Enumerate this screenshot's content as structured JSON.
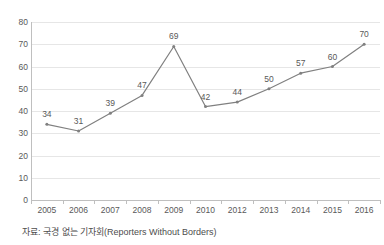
{
  "chart_data": {
    "type": "line",
    "title": "",
    "xlabel": "",
    "ylabel": "",
    "categories": [
      "2005",
      "2006",
      "2007",
      "2008",
      "2009",
      "2010",
      "2012",
      "2013",
      "2014",
      "2015",
      "2016"
    ],
    "values": [
      34,
      31,
      39,
      47,
      69,
      42,
      44,
      50,
      57,
      60,
      70
    ],
    "point_labels": [
      "34",
      "31",
      "39",
      "47",
      "69",
      "42",
      "44",
      "50",
      "57",
      "60",
      "70"
    ],
    "ylim": [
      0,
      80
    ],
    "y_ticks": [
      0,
      10,
      20,
      30,
      40,
      50,
      60,
      70,
      80
    ],
    "y_tick_labels": [
      "0",
      "10",
      "20",
      "30",
      "40",
      "50",
      "60",
      "70",
      "80"
    ],
    "grid": true,
    "legend": "none",
    "series_color": "#808080",
    "gridline_color": "#e6e6e6",
    "axis_color": "#bfbfbf",
    "text_color": "#595959",
    "data_labels_shown": true,
    "markers": true
  },
  "source_note": "자료: 국경 없는 기자회(Reporters Without Borders)"
}
